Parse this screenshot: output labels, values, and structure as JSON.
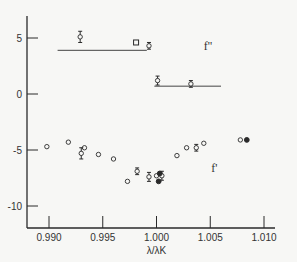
{
  "chart_data": {
    "type": "scatter",
    "title": "",
    "xlabel": "λ/λK",
    "ylabel": "",
    "xlim": [
      0.9878,
      1.0102
    ],
    "ylim": [
      -12.0,
      7.0
    ],
    "grid": false,
    "x_ticks": [
      0.99,
      0.995,
      1.0,
      1.005,
      1.01
    ],
    "x_tick_labels": [
      "0.990",
      "0.995",
      "1.000",
      "1.005",
      "1.010"
    ],
    "y_ticks": [
      5,
      0,
      -5,
      -10
    ],
    "y_tick_labels": [
      "5",
      "0",
      "-5",
      "-10"
    ],
    "annotations": [
      {
        "text": "f''",
        "x": 1.0044,
        "y": 3.9
      },
      {
        "text": "f'",
        "x": 1.0051,
        "y": -7.0
      }
    ],
    "reference_lines": [
      {
        "name": "f'' below edge",
        "x": [
          0.9908,
          0.9991
        ],
        "y": [
          3.9,
          3.9
        ]
      },
      {
        "name": "f'' above edge",
        "x": [
          0.9998,
          1.006
        ],
        "y": [
          0.7,
          0.7
        ]
      }
    ],
    "series": [
      {
        "name": "f'' open (with error bars)",
        "marker": "open-circle-errorbar",
        "points": [
          {
            "x": 0.9929,
            "y": 5.1,
            "err": 0.5
          },
          {
            "x": 0.9993,
            "y": 4.3,
            "err": 0.3
          },
          {
            "x": 1.0001,
            "y": 1.2,
            "err": 0.4
          },
          {
            "x": 1.0032,
            "y": 0.9,
            "err": 0.3
          }
        ]
      },
      {
        "name": "f'' square",
        "marker": "open-square",
        "points": [
          {
            "x": 0.9981,
            "y": 4.6
          }
        ]
      },
      {
        "name": "f' open",
        "marker": "open-circle",
        "points": [
          {
            "x": 0.9898,
            "y": -4.7
          },
          {
            "x": 0.9918,
            "y": -4.3
          },
          {
            "x": 0.9933,
            "y": -4.8
          },
          {
            "x": 0.9946,
            "y": -5.4
          },
          {
            "x": 0.996,
            "y": -5.8
          },
          {
            "x": 0.9973,
            "y": -7.8
          },
          {
            "x": 1.0,
            "y": -7.3
          },
          {
            "x": 1.0019,
            "y": -5.5
          },
          {
            "x": 1.0028,
            "y": -4.8
          },
          {
            "x": 1.0044,
            "y": -4.4
          },
          {
            "x": 1.0078,
            "y": -4.1
          }
        ]
      },
      {
        "name": "f' open (with error bars)",
        "marker": "open-circle-errorbar",
        "points": [
          {
            "x": 0.993,
            "y": -5.3,
            "err": 0.5
          },
          {
            "x": 0.9982,
            "y": -6.9,
            "err": 0.3
          },
          {
            "x": 0.9993,
            "y": -7.4,
            "err": 0.4
          },
          {
            "x": 1.0005,
            "y": -7.3,
            "err": 0.4
          },
          {
            "x": 1.0037,
            "y": -4.8,
            "err": 0.3
          }
        ]
      },
      {
        "name": "f' filled",
        "marker": "filled-circle",
        "points": [
          {
            "x": 1.0003,
            "y": -7.1
          },
          {
            "x": 1.0002,
            "y": -7.8
          },
          {
            "x": 1.0084,
            "y": -4.1
          }
        ]
      }
    ]
  }
}
